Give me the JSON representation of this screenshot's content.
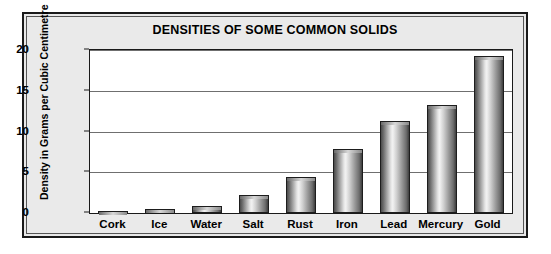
{
  "chart_data": {
    "type": "bar",
    "title": "DENSITIES OF SOME COMMON SOLIDS",
    "xlabel": "",
    "ylabel": "Density in Grams per Cubic Centimetre",
    "categories": [
      "Cork",
      "Ice",
      "Water",
      "Salt",
      "Rust",
      "Iron",
      "Lead",
      "Mercury",
      "Gold"
    ],
    "values": [
      0.2,
      0.5,
      0.8,
      2.2,
      4.4,
      7.8,
      11.3,
      13.2,
      19.3
    ],
    "ylim": [
      0,
      20
    ],
    "yticks": [
      0,
      5,
      10,
      15,
      20
    ],
    "ytick_labels": [
      "0",
      "5",
      "10",
      "15",
      "20"
    ],
    "grid": true,
    "legend": false,
    "legend_position": "none",
    "bar_color": "#b0b0b0",
    "bar_edge_color": "#1d1d1d",
    "plot_background": "#ffffff",
    "panel_background": "#e8e8e8",
    "gridline_color": "#6f6f6f"
  }
}
